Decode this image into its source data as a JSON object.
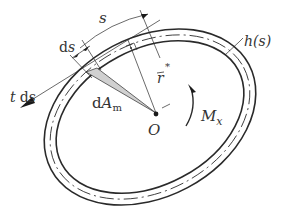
{
  "figure": {
    "labels": {
      "s": "s",
      "ds": "d",
      "ds_var": "s",
      "h_s": "h(s)",
      "r_bar": "r",
      "r_star": "*",
      "t_ds_t": "t",
      "t_ds_d": "d",
      "t_ds_s": "s",
      "dAm_d": "d",
      "dAm_A": "A",
      "dAm_sub": "m",
      "origin": "O",
      "moment_M": "M",
      "moment_sub": "x"
    },
    "colors": {
      "line": "#2a2a2a",
      "shade": "#d0d0d0",
      "background": "#ffffff"
    }
  }
}
